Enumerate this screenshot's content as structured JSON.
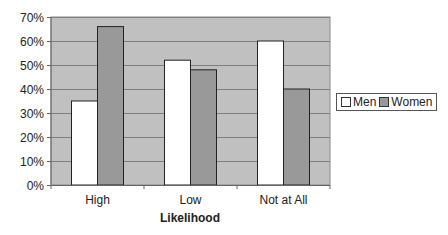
{
  "chart_data": {
    "type": "bar",
    "title": "",
    "xlabel": "Likelihood",
    "ylabel": "",
    "categories": [
      "High",
      "Low",
      "Not at All"
    ],
    "series": [
      {
        "name": "Men",
        "values": [
          35,
          52,
          60
        ],
        "color": "#ffffff"
      },
      {
        "name": "Women",
        "values": [
          66,
          48,
          40
        ],
        "color": "#999999"
      }
    ],
    "ylim": [
      0,
      70
    ],
    "yticks": [
      0,
      10,
      20,
      30,
      40,
      50,
      60,
      70
    ],
    "ytick_format": "percent",
    "grid": true,
    "legend_position": "right",
    "plot_background": "#c0c0c0",
    "gridline_color": "#808080"
  },
  "legend": {
    "items": [
      {
        "label": "Men",
        "color": "#ffffff"
      },
      {
        "label": "Women",
        "color": "#999999"
      }
    ]
  }
}
